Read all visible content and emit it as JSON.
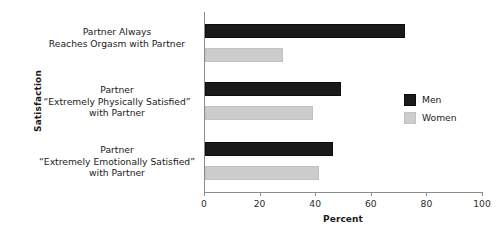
{
  "chart_data": {
    "type": "bar",
    "orientation": "horizontal",
    "title": "",
    "xlabel": "Percent",
    "ylabel": "Satisfaction",
    "xlim": [
      0,
      100
    ],
    "xticks": [
      0,
      20,
      40,
      60,
      80,
      100
    ],
    "grid": false,
    "legend_position": "right",
    "categories": [
      [
        "Partner Always",
        "Reaches Orgasm with Partner"
      ],
      [
        "Partner",
        "“Extremely Physically Satisfied”",
        "with Partner"
      ],
      [
        "Partner",
        "“Extremely Emotionally Satisfied”",
        "with Partner"
      ]
    ],
    "series": [
      {
        "name": "Men",
        "color": "#1a1a1a",
        "values": [
          72,
          49,
          46
        ]
      },
      {
        "name": "Women",
        "color": "#cccccc",
        "values": [
          28,
          39,
          41
        ]
      }
    ]
  },
  "axis": {
    "y_title": "Satisfaction",
    "x_title": "Percent",
    "tick_labels": [
      "0",
      "20",
      "40",
      "60",
      "80",
      "100"
    ]
  },
  "legend": {
    "items": [
      {
        "label": "Men"
      },
      {
        "label": "Women"
      }
    ]
  },
  "categories_flat": [
    {
      "l0": "Partner Always",
      "l1": "Reaches Orgasm with Partner",
      "l2": ""
    },
    {
      "l0": "Partner",
      "l1": "“Extremely Physically Satisfied”",
      "l2": "with Partner"
    },
    {
      "l0": "Partner",
      "l1": "“Extremely Emotionally Satisfied”",
      "l2": "with Partner"
    }
  ]
}
